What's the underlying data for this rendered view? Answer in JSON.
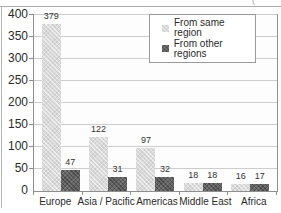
{
  "figure": {
    "background": "#ffffff",
    "corner_fragment": "( )"
  },
  "chart_data": {
    "type": "bar",
    "title": "",
    "xlabel": "",
    "ylabel": "",
    "categories": [
      "Europe",
      "Asia / Pacific",
      "Americas",
      "Middle East",
      "Africa"
    ],
    "series": [
      {
        "name": "From same region",
        "color": "#d9d9d9",
        "values": [
          379,
          122,
          97,
          18,
          16
        ]
      },
      {
        "name": "From other regions",
        "color": "#636363",
        "values": [
          47,
          31,
          32,
          18,
          17
        ]
      }
    ],
    "yticks": [
      0,
      50,
      100,
      150,
      200,
      250,
      300,
      350,
      400
    ],
    "ylim": [
      0,
      400
    ],
    "grid": true,
    "legend_position": "top-right",
    "colors": {
      "gridline": "#cdcdcd",
      "axis": "#8f8f8f",
      "text": "#2b2b2b",
      "legend_border": "#9a9a9a",
      "plot_background": "#fdfdfd"
    }
  }
}
